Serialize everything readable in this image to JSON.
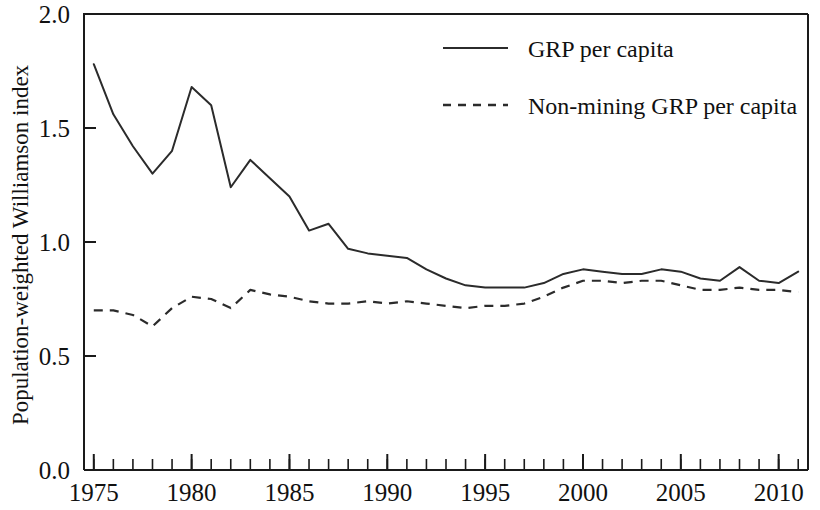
{
  "chart_data": {
    "type": "line",
    "title": "",
    "subtitle": "",
    "xlabel": "",
    "ylabel": "Population-weighted Williamson index",
    "xlim": [
      1974.5,
      2011.5
    ],
    "ylim": [
      0.0,
      2.0
    ],
    "grid": false,
    "legend_position": "top-center-right",
    "y_ticks": [
      "0.0",
      "0.5",
      "1.0",
      "1.5",
      "2.0"
    ],
    "y_tick_values": [
      0.0,
      0.5,
      1.0,
      1.5,
      2.0
    ],
    "x_ticks": [
      "1975",
      "1980",
      "1985",
      "1990",
      "1995",
      "2000",
      "2005",
      "2010"
    ],
    "x_tick_values": [
      1975,
      1980,
      1985,
      1990,
      1995,
      2000,
      2005,
      2010
    ],
    "x_minor_step": 1,
    "x": [
      1975,
      1976,
      1977,
      1978,
      1979,
      1980,
      1981,
      1982,
      1983,
      1984,
      1985,
      1986,
      1987,
      1988,
      1989,
      1990,
      1991,
      1992,
      1993,
      1994,
      1995,
      1996,
      1997,
      1998,
      1999,
      2000,
      2001,
      2002,
      2003,
      2004,
      2005,
      2006,
      2007,
      2008,
      2009,
      2010,
      2011
    ],
    "series": [
      {
        "name": "GRP per capita",
        "style": "solid",
        "color": "#2b2b2b",
        "values": [
          1.78,
          1.56,
          1.42,
          1.3,
          1.4,
          1.68,
          1.6,
          1.24,
          1.36,
          1.28,
          1.2,
          1.05,
          1.08,
          0.97,
          0.95,
          0.94,
          0.93,
          0.88,
          0.84,
          0.81,
          0.8,
          0.8,
          0.8,
          0.82,
          0.86,
          0.88,
          0.87,
          0.86,
          0.86,
          0.88,
          0.87,
          0.84,
          0.83,
          0.89,
          0.83,
          0.82,
          0.87
        ]
      },
      {
        "name": "Non-mining GRP per capita",
        "style": "dashed",
        "color": "#2b2b2b",
        "values": [
          0.7,
          0.7,
          0.68,
          0.63,
          0.71,
          0.76,
          0.75,
          0.71,
          0.79,
          0.77,
          0.76,
          0.74,
          0.73,
          0.73,
          0.74,
          0.73,
          0.74,
          0.73,
          0.72,
          0.71,
          0.72,
          0.72,
          0.73,
          0.76,
          0.8,
          0.83,
          0.83,
          0.82,
          0.83,
          0.83,
          0.81,
          0.79,
          0.79,
          0.8,
          0.79,
          0.79,
          0.78
        ]
      }
    ],
    "legend": [
      {
        "label": "GRP per capita",
        "style": "solid"
      },
      {
        "label": "Non-mining GRP per capita",
        "style": "dashed"
      }
    ]
  },
  "axes": {
    "y_label": "Population-weighted Williamson index"
  }
}
